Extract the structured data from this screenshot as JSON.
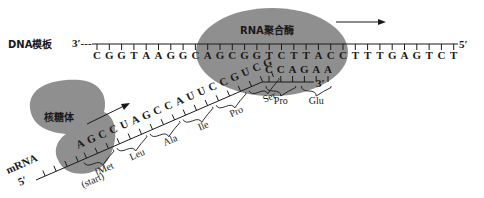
{
  "labels": {
    "dna_template": "DNA模板",
    "rna_polymerase": "RNA聚合酶",
    "ribosome": "核糖体",
    "mrna": "mRNA",
    "dna_3prime": "3′---",
    "dna_5prime": "5′",
    "mrna_5prime": "5′",
    "mrna_3prime": "3′",
    "start_note": "(start)"
  },
  "dna_template_bases": [
    "C",
    "G",
    "G",
    "T",
    "A",
    "A",
    "G",
    "G",
    "C",
    "A",
    "G",
    "C",
    "G",
    "G",
    "T",
    "C",
    "T",
    "T",
    "A",
    "C",
    "C",
    "T",
    "T",
    "T",
    "G",
    "A",
    "G",
    "T",
    "C",
    "T"
  ],
  "mrna_diagonal_bases": [
    "A",
    "G",
    "C",
    "C",
    "U",
    "A",
    "G",
    "C",
    "C",
    "A",
    "U",
    "U",
    "C",
    "C",
    "G",
    "U",
    "C",
    "G"
  ],
  "mrna_horizontal_bases": [
    "C",
    "C",
    "A",
    "G",
    "A",
    "A"
  ],
  "amino_acids_diagonal": [
    "fMet",
    "Leu",
    "Ala",
    "Ile",
    "Pro",
    "Ser"
  ],
  "amino_acids_horizontal": [
    "Pro",
    "Glu"
  ],
  "colors": {
    "blob": "#8c8c8c",
    "line": "#1a1a1a"
  }
}
